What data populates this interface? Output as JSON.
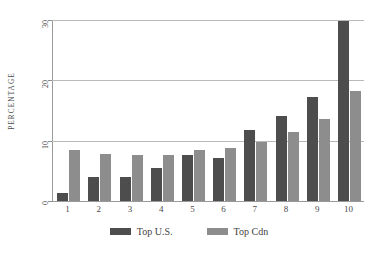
{
  "chart_data": {
    "type": "bar",
    "title": "",
    "subtitle": "",
    "xlabel": "",
    "ylabel": "PERCENTAGE",
    "categories": [
      "1",
      "2",
      "3",
      "4",
      "5",
      "6",
      "7",
      "8",
      "9",
      "10"
    ],
    "series": [
      {
        "name": "Top U.S.",
        "color": "#4d4d4d",
        "values": [
          1.3,
          3.9,
          3.9,
          5.4,
          7.7,
          7.2,
          11.8,
          14.1,
          17.3,
          29.8
        ]
      },
      {
        "name": "Top Cdn",
        "color": "#8d8d8d",
        "values": [
          8.5,
          7.8,
          7.6,
          7.7,
          8.4,
          8.8,
          9.8,
          11.4,
          13.6,
          18.3
        ]
      }
    ],
    "ylim": [
      0,
      30
    ],
    "yticks": [
      0,
      10,
      20,
      30
    ],
    "ytick_labels": [
      "0",
      "10",
      "20",
      "30"
    ],
    "grid": true,
    "legend_position": "bottom"
  },
  "legend": {
    "items": [
      {
        "label": "Top U.S.",
        "swatch": "us"
      },
      {
        "label": "Top Cdn",
        "swatch": "cdn"
      }
    ]
  },
  "colors": {
    "series_us": "#4d4d4d",
    "series_cdn": "#8d8d8d",
    "gridline": "#b9b9b9",
    "axis": "#9a9a9a",
    "text": "#4a4a4a",
    "background": "#ffffff"
  }
}
